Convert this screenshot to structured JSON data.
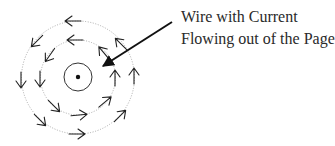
{
  "diagram": {
    "label": {
      "line1": "Wire with Current",
      "line2": "Flowing out of the Page"
    },
    "wire": {
      "center": [
        78,
        77
      ],
      "ring_radius": 14,
      "dot_radius": 2.2,
      "symbol": "dot (current out of page)"
    },
    "field_lines": [
      {
        "name": "inner",
        "radius": 37.5,
        "style": "dotted",
        "arrow_count": 8,
        "direction": "counterclockwise"
      },
      {
        "name": "outer",
        "radius": 56.5,
        "style": "dotted",
        "arrow_count": 8,
        "direction": "counterclockwise"
      }
    ],
    "pointer": {
      "from": [
        172,
        22
      ],
      "to": [
        101,
        67
      ],
      "head": "filled"
    },
    "colors": {
      "ink": "#1a1a1a",
      "dotted_circle": "#9a9a9a",
      "text": "#2a2a2a",
      "background": "#ffffff"
    }
  }
}
